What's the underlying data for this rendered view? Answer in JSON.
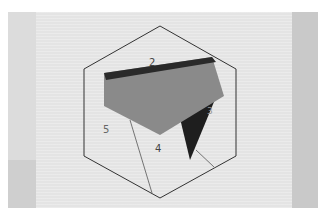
{
  "scene": {
    "description": "Photo of a paper-pieced hexagon quilt block template with fabric pieces",
    "labels": [
      {
        "text": "2",
        "x": 152,
        "y": 64
      },
      {
        "text": "3",
        "x": 209,
        "y": 112
      },
      {
        "text": "4",
        "x": 158,
        "y": 150
      },
      {
        "text": "5",
        "x": 106,
        "y": 131
      }
    ],
    "colors": {
      "background": "#e4e4e4",
      "grey_fabric": "#8a8a8a",
      "dark_fabric": "#1e1e1e",
      "line": "#333333"
    }
  }
}
